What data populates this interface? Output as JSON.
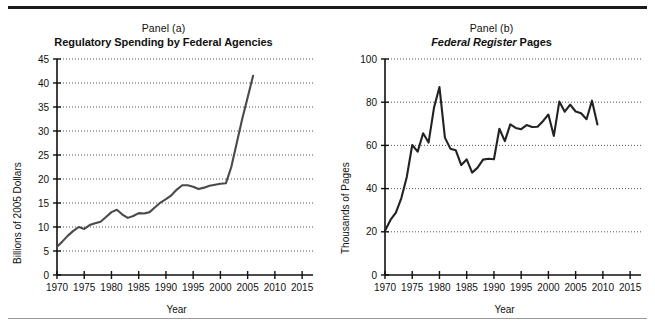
{
  "figure": {
    "panels": [
      {
        "id": "panel-a",
        "panel_label": "Panel (a)",
        "heading_italic": "",
        "heading_plain": "Regulatory Spending by Federal Agencies",
        "ylabel": "Billions of 2005 Dollars",
        "xlabel": "Year"
      },
      {
        "id": "panel-b",
        "panel_label": "Panel (b)",
        "heading_italic": "Federal Register",
        "heading_plain": " Pages",
        "ylabel": "Thousands of Pages",
        "xlabel": "Year"
      }
    ]
  },
  "chart_data": [
    {
      "type": "line",
      "title": "Regulatory Spending by Federal Agencies",
      "subtitle": "Panel (a)",
      "xlabel": "Year",
      "ylabel": "Billions of 2005 Dollars",
      "xlim": [
        1970,
        2017
      ],
      "ylim": [
        0,
        45
      ],
      "xticks": [
        1970,
        1975,
        1980,
        1985,
        1990,
        1995,
        2000,
        2005,
        2010,
        2015
      ],
      "yticks": [
        0,
        5,
        10,
        15,
        20,
        25,
        30,
        35,
        40,
        45
      ],
      "grid": "horizontal-dotted",
      "line_color": "#4a4a4a",
      "x": [
        1970,
        1971,
        1972,
        1973,
        1974,
        1975,
        1976,
        1977,
        1978,
        1979,
        1980,
        1981,
        1982,
        1983,
        1984,
        1985,
        1986,
        1987,
        1988,
        1989,
        1990,
        1991,
        1992,
        1993,
        1994,
        1995,
        1996,
        1997,
        1998,
        1999,
        2000,
        2001,
        2002,
        2003,
        2004,
        2005,
        2006
      ],
      "values": [
        5.9,
        7.0,
        8.2,
        9.2,
        10.0,
        9.6,
        10.4,
        10.8,
        11.1,
        12.1,
        13.1,
        13.6,
        12.6,
        11.9,
        12.3,
        12.9,
        12.8,
        13.1,
        14.1,
        15.1,
        15.8,
        16.6,
        17.8,
        18.7,
        18.7,
        18.4,
        17.9,
        18.2,
        18.6,
        18.8,
        19.0,
        19.1,
        22.5,
        27.5,
        32.5,
        37.0,
        41.5
      ]
    },
    {
      "type": "line",
      "title": "Federal Register Pages",
      "subtitle": "Panel (b)",
      "xlabel": "Year",
      "ylabel": "Thousands of Pages",
      "xlim": [
        1970,
        2017
      ],
      "ylim": [
        0,
        100
      ],
      "xticks": [
        1970,
        1975,
        1980,
        1985,
        1990,
        1995,
        2000,
        2005,
        2010,
        2015
      ],
      "yticks": [
        0,
        20,
        40,
        60,
        80,
        100
      ],
      "grid": "horizontal-dotted",
      "line_color": "#222222",
      "x": [
        1970,
        1971,
        1972,
        1973,
        1974,
        1975,
        1976,
        1977,
        1978,
        1979,
        1980,
        1981,
        1982,
        1983,
        1984,
        1985,
        1986,
        1987,
        1988,
        1989,
        1990,
        1991,
        1992,
        1993,
        1994,
        1995,
        1996,
        1997,
        1998,
        1999,
        2000,
        2001,
        2002,
        2003,
        2004,
        2005,
        2006,
        2007,
        2008,
        2009
      ],
      "values": [
        20.5,
        25.5,
        28.9,
        35.6,
        45.4,
        60.2,
        57.1,
        65.6,
        61.3,
        77.5,
        87.0,
        63.6,
        58.5,
        57.7,
        50.9,
        53.5,
        47.4,
        49.7,
        53.4,
        53.8,
        53.6,
        67.7,
        62.0,
        69.7,
        68.1,
        67.5,
        69.4,
        68.5,
        68.6,
        71.2,
        74.3,
        64.4,
        80.3,
        75.6,
        78.9,
        75.7,
        74.9,
        72.1,
        80.7,
        69.7
      ]
    }
  ]
}
